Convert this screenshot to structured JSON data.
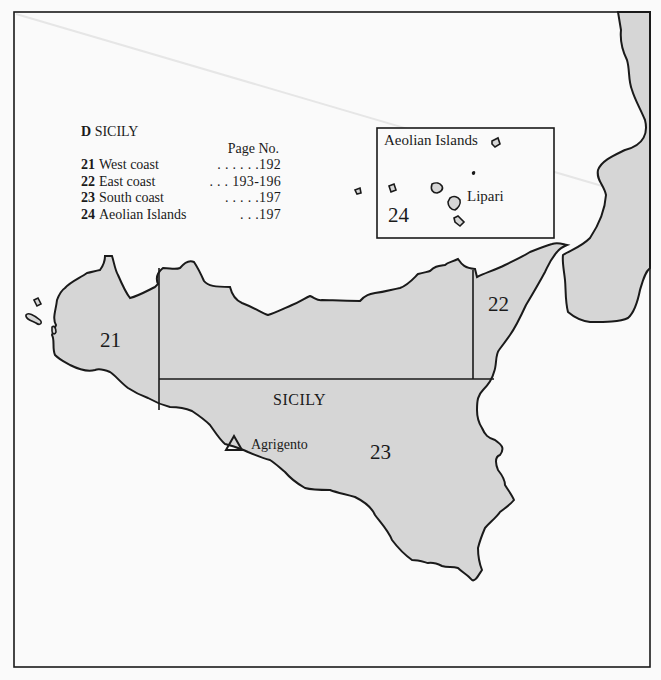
{
  "map": {
    "title_prefix": "D",
    "title": "SICILY",
    "legend": {
      "page_header": "Page No.",
      "items": [
        {
          "number": "21",
          "label": "West coast",
          "dots": ". . . . . .",
          "page": "192"
        },
        {
          "number": "22",
          "label": "East coast",
          "dots": ". . .",
          "page": "193-196"
        },
        {
          "number": "23",
          "label": "South coast",
          "dots": ". . . . .",
          "page": "197"
        },
        {
          "number": "24",
          "label": "Aeolian Islands",
          "dots": ". . .",
          "page": "197"
        }
      ]
    },
    "inset": {
      "title": "Aeolian Islands",
      "place": "Lipari",
      "region_number": "24"
    },
    "regions": {
      "r21": "21",
      "r22": "22",
      "r23": "23"
    },
    "island_label": "SICILY",
    "city": {
      "name": "Agrigento",
      "symbol": "triangle"
    },
    "colors": {
      "land": "#d6d6d6",
      "sea": "#fafafa",
      "outline": "#1a1a1a"
    }
  }
}
